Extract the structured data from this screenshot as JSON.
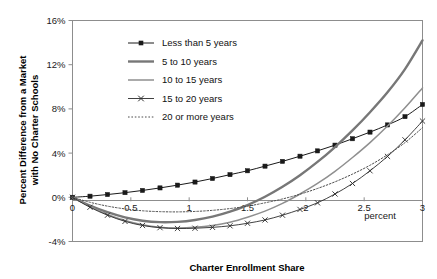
{
  "chart_data": {
    "type": "line",
    "title": "",
    "xlabel": "Charter Enrollment Share",
    "ylabel": "Percent Difference from a Market with No Charter Schools",
    "ylabel_line1": "Percent Difference from a Market",
    "ylabel_line2": "with No Charter Schools",
    "x_unit_note": "percent",
    "xlim": [
      0,
      3
    ],
    "ylim": [
      -4,
      16
    ],
    "grid": false,
    "legend_position": "inside-top-left",
    "x_ticks": [
      "0",
      "0.5",
      "1",
      "1.5",
      "2",
      "2.5",
      "3"
    ],
    "x_tick_values": [
      0,
      0.5,
      1,
      1.5,
      2,
      2.5,
      3
    ],
    "y_ticks": [
      "-4%",
      "0%",
      "4%",
      "8%",
      "12%",
      "16%"
    ],
    "y_tick_values": [
      -4,
      0,
      4,
      8,
      12,
      16
    ],
    "x": [
      0,
      0.15,
      0.3,
      0.45,
      0.6,
      0.75,
      0.9,
      1.05,
      1.2,
      1.35,
      1.5,
      1.65,
      1.8,
      1.95,
      2.1,
      2.25,
      2.4,
      2.55,
      2.7,
      2.85,
      3
    ],
    "series": [
      {
        "name": "Less than 5 years",
        "style": "solid-with-square-markers",
        "color": "#1a1a1a",
        "width": 1,
        "marker": "square",
        "values": [
          0.0,
          0.1,
          0.25,
          0.42,
          0.62,
          0.85,
          1.1,
          1.38,
          1.7,
          2.05,
          2.4,
          2.82,
          3.25,
          3.72,
          4.2,
          4.72,
          5.3,
          5.9,
          6.55,
          7.3,
          8.4
        ]
      },
      {
        "name": "5 to 10 years",
        "style": "solid-thick",
        "color": "#777777",
        "width": 2.4,
        "marker": "none",
        "values": [
          0.0,
          -0.75,
          -1.35,
          -1.82,
          -2.12,
          -2.25,
          -2.22,
          -2.05,
          -1.75,
          -1.3,
          -0.7,
          0.05,
          0.95,
          2.0,
          3.2,
          4.55,
          6.05,
          7.7,
          9.5,
          11.6,
          14.2
        ]
      },
      {
        "name": "10 to 15 years",
        "style": "solid-medium",
        "color": "#8f8f8f",
        "width": 1.5,
        "marker": "none",
        "values": [
          0.0,
          -0.85,
          -1.55,
          -2.1,
          -2.48,
          -2.7,
          -2.78,
          -2.72,
          -2.55,
          -2.25,
          -1.8,
          -1.25,
          -0.55,
          0.3,
          1.25,
          2.35,
          3.6,
          4.95,
          6.45,
          8.1,
          9.9
        ]
      },
      {
        "name": "15 to 20 years",
        "style": "solid-with-x-markers",
        "color": "#2b2b2b",
        "width": 0.9,
        "marker": "x",
        "values": [
          0.0,
          -0.9,
          -1.62,
          -2.18,
          -2.55,
          -2.75,
          -2.82,
          -2.8,
          -2.72,
          -2.58,
          -2.35,
          -2.05,
          -1.62,
          -1.1,
          -0.5,
          0.3,
          1.25,
          2.4,
          3.7,
          5.2,
          6.9
        ]
      },
      {
        "name": "20 or more years",
        "style": "dotted",
        "color": "#4d4d4d",
        "width": 1,
        "marker": "none",
        "values": [
          0.0,
          -0.45,
          -0.8,
          -1.05,
          -1.22,
          -1.3,
          -1.32,
          -1.28,
          -1.18,
          -1.02,
          -0.8,
          -0.5,
          -0.15,
          0.28,
          0.8,
          1.4,
          2.1,
          2.9,
          3.85,
          4.95,
          6.3
        ]
      }
    ]
  },
  "legend": {
    "items": [
      {
        "label": "Less than 5 years"
      },
      {
        "label": "5 to 10 years"
      },
      {
        "label": "10 to 15 years"
      },
      {
        "label": "15 to 20 years"
      },
      {
        "label": "20 or more years"
      }
    ]
  }
}
